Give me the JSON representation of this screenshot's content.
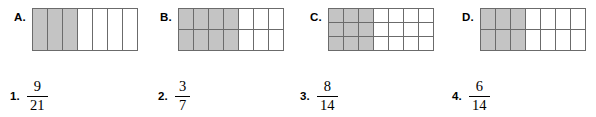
{
  "worksheet": {
    "shade_color": "#c4c4c4",
    "line_color": "#6b6b6b",
    "background": "#ffffff"
  },
  "diagrams": [
    {
      "label": "A.",
      "rows": 1,
      "cols": 7,
      "shaded_cols": 3,
      "shaded_cells": 3,
      "total_cells": 7,
      "left": 14,
      "cell_width": 15,
      "cell_height": 42
    },
    {
      "label": "B.",
      "rows": 2,
      "cols": 7,
      "shaded_cols": 4,
      "shaded_cells": 8,
      "total_cells": 14,
      "left": 160,
      "cell_width": 15,
      "cell_height": 21
    },
    {
      "label": "C.",
      "rows": 3,
      "cols": 7,
      "shaded_cols": 3,
      "shaded_cells": 9,
      "total_cells": 21,
      "left": 310,
      "cell_width": 15,
      "cell_height": 14
    },
    {
      "label": "D.",
      "rows": 2,
      "cols": 7,
      "shaded_cols": 3,
      "shaded_cells": 6,
      "total_cells": 14,
      "left": 462,
      "cell_width": 15,
      "cell_height": 21
    }
  ],
  "fractions": [
    {
      "number": "1.",
      "numerator": "9",
      "denominator": "21",
      "left": 10
    },
    {
      "number": "2.",
      "numerator": "3",
      "denominator": "7",
      "left": 158
    },
    {
      "number": "3.",
      "numerator": "8",
      "denominator": "14",
      "left": 300
    },
    {
      "number": "4.",
      "numerator": "6",
      "denominator": "14",
      "left": 452
    }
  ]
}
